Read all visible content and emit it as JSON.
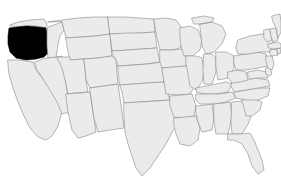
{
  "map": {
    "title": "United States state map",
    "region": "United States (contiguous 48 states)",
    "projection": "albers-usa",
    "background_color": "#ffffff",
    "state_fill_color": "#ebebeb",
    "state_border_color": "#888888",
    "highlight_fill_color": "#000000",
    "highlighted_states": [
      "Oregon"
    ],
    "highlight_label": "Oregon",
    "width": 281,
    "height": 192,
    "labels_visible": false,
    "legend_visible": false,
    "states": [
      {
        "code": "WA",
        "name": "Washington",
        "highlighted": false
      },
      {
        "code": "OR",
        "name": "Oregon",
        "highlighted": true
      },
      {
        "code": "CA",
        "name": "California",
        "highlighted": false
      },
      {
        "code": "NV",
        "name": "Nevada",
        "highlighted": false
      },
      {
        "code": "ID",
        "name": "Idaho",
        "highlighted": false
      },
      {
        "code": "MT",
        "name": "Montana",
        "highlighted": false
      },
      {
        "code": "WY",
        "name": "Wyoming",
        "highlighted": false
      },
      {
        "code": "UT",
        "name": "Utah",
        "highlighted": false
      },
      {
        "code": "AZ",
        "name": "Arizona",
        "highlighted": false
      },
      {
        "code": "CO",
        "name": "Colorado",
        "highlighted": false
      },
      {
        "code": "NM",
        "name": "New Mexico",
        "highlighted": false
      },
      {
        "code": "ND",
        "name": "North Dakota",
        "highlighted": false
      },
      {
        "code": "SD",
        "name": "South Dakota",
        "highlighted": false
      },
      {
        "code": "NE",
        "name": "Nebraska",
        "highlighted": false
      },
      {
        "code": "KS",
        "name": "Kansas",
        "highlighted": false
      },
      {
        "code": "OK",
        "name": "Oklahoma",
        "highlighted": false
      },
      {
        "code": "TX",
        "name": "Texas",
        "highlighted": false
      },
      {
        "code": "MN",
        "name": "Minnesota",
        "highlighted": false
      },
      {
        "code": "IA",
        "name": "Iowa",
        "highlighted": false
      },
      {
        "code": "MO",
        "name": "Missouri",
        "highlighted": false
      },
      {
        "code": "AR",
        "name": "Arkansas",
        "highlighted": false
      },
      {
        "code": "LA",
        "name": "Louisiana",
        "highlighted": false
      },
      {
        "code": "WI",
        "name": "Wisconsin",
        "highlighted": false
      },
      {
        "code": "IL",
        "name": "Illinois",
        "highlighted": false
      },
      {
        "code": "MI",
        "name": "Michigan",
        "highlighted": false
      },
      {
        "code": "IN",
        "name": "Indiana",
        "highlighted": false
      },
      {
        "code": "OH",
        "name": "Ohio",
        "highlighted": false
      },
      {
        "code": "KY",
        "name": "Kentucky",
        "highlighted": false
      },
      {
        "code": "TN",
        "name": "Tennessee",
        "highlighted": false
      },
      {
        "code": "MS",
        "name": "Mississippi",
        "highlighted": false
      },
      {
        "code": "AL",
        "name": "Alabama",
        "highlighted": false
      },
      {
        "code": "GA",
        "name": "Georgia",
        "highlighted": false
      },
      {
        "code": "FL",
        "name": "Florida",
        "highlighted": false
      },
      {
        "code": "SC",
        "name": "South Carolina",
        "highlighted": false
      },
      {
        "code": "NC",
        "name": "North Carolina",
        "highlighted": false
      },
      {
        "code": "VA",
        "name": "Virginia",
        "highlighted": false
      },
      {
        "code": "WV",
        "name": "West Virginia",
        "highlighted": false
      },
      {
        "code": "MD",
        "name": "Maryland",
        "highlighted": false
      },
      {
        "code": "DE",
        "name": "Delaware",
        "highlighted": false
      },
      {
        "code": "PA",
        "name": "Pennsylvania",
        "highlighted": false
      },
      {
        "code": "NJ",
        "name": "New Jersey",
        "highlighted": false
      },
      {
        "code": "NY",
        "name": "New York",
        "highlighted": false
      },
      {
        "code": "CT",
        "name": "Connecticut",
        "highlighted": false
      },
      {
        "code": "RI",
        "name": "Rhode Island",
        "highlighted": false
      },
      {
        "code": "MA",
        "name": "Massachusetts",
        "highlighted": false
      },
      {
        "code": "VT",
        "name": "Vermont",
        "highlighted": false
      },
      {
        "code": "NH",
        "name": "New Hampshire",
        "highlighted": false
      },
      {
        "code": "ME",
        "name": "Maine",
        "highlighted": false
      }
    ]
  }
}
